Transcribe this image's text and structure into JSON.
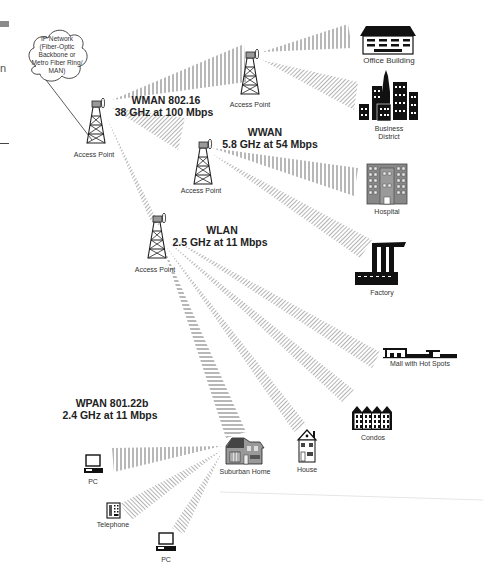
{
  "diagram": {
    "cloud": {
      "lines": [
        "IP Network",
        "(Fiber-Optic",
        "Backbone or",
        "Metro Fiber Ring/",
        "MAN)"
      ]
    },
    "networks": {
      "wman": {
        "name": "WMAN 802.16",
        "spec": "38 GHz at 100 Mbps"
      },
      "wwan": {
        "name": "WWAN",
        "spec": "5.8 GHz at 54 Mbps"
      },
      "wlan": {
        "name": "WLAN",
        "spec": "2.5 GHz at 11 Mbps"
      },
      "wpan": {
        "name": "WPAN 801.22b",
        "spec": "2.4 GHz at 11 Mbps"
      }
    },
    "access_points": [
      {
        "label": "Access Point"
      },
      {
        "label": "Access Point"
      },
      {
        "label": "Access Point"
      },
      {
        "label": "Access Point"
      }
    ],
    "endpoints": {
      "office_building": "Office Building",
      "business_district": [
        "Business",
        "District"
      ],
      "hospital": "Hospital",
      "factory": "Factory",
      "mall": "Mall with Hot Spots",
      "condos": "Condos",
      "house": "House",
      "suburban_home": "Suburban Home",
      "pc1": "PC",
      "telephone": "Telephone",
      "pc2": "PC"
    },
    "edge": {
      "partial_text": "n"
    }
  }
}
